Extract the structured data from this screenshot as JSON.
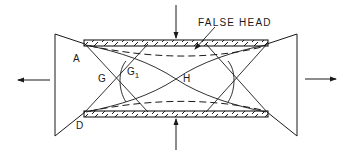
{
  "diagram": {
    "type": "schematic",
    "stroke_color": "#1a1a1a",
    "background": "#ffffff",
    "labels": {
      "false_head": "FALSE HEAD",
      "A": "A",
      "D": "D",
      "G": "G",
      "G1_base": "G",
      "G1_sub": "1",
      "H": "H"
    },
    "arrows": {
      "top": "downward force arrow",
      "bottom": "upward force arrow",
      "left": "leftward flow arrow",
      "right": "rightward flow arrow"
    },
    "elements": [
      "top-hatched-plate",
      "bottom-hatched-plate",
      "left-wedge",
      "right-wedge",
      "dashed-false-head-curves",
      "solid-slip-curves"
    ]
  }
}
